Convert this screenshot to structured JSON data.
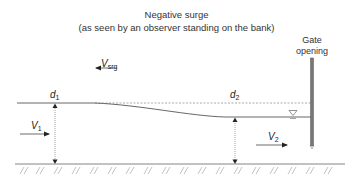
{
  "title": {
    "line1": "Negative surge",
    "line2": "(as seen by an observer standing on the bank)"
  },
  "labels": {
    "gate_line1": "Gate",
    "gate_line2": "opening",
    "v_srg_base": "V",
    "v_srg_sub": "srg",
    "d1_base": "d",
    "d1_sub": "1",
    "d2_base": "d",
    "d2_sub": "2",
    "v1_base": "V",
    "v1_sub": "1",
    "v2_base": "V",
    "v2_sub": "2"
  },
  "colors": {
    "line": "#555555",
    "dashed": "#888888",
    "gate": "#666666",
    "hatch": "#999999"
  }
}
